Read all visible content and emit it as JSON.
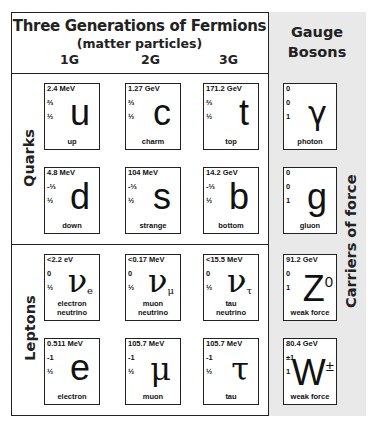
{
  "header": {
    "title": "Three Generations of Fermions",
    "subtitle": "(matter particles)",
    "generations": [
      "1G",
      "2G",
      "3G"
    ],
    "gauge_title_line1": "Gauge",
    "gauge_title_line2": "Bosons"
  },
  "row_labels": {
    "quarks": "Quarks",
    "leptons": "Leptons",
    "carriers": "Carriers of force"
  },
  "quarks": [
    {
      "mass": "2.4 MeV",
      "charge": "⅔",
      "spin": "½",
      "symbol": "u",
      "sub": "",
      "name": "up"
    },
    {
      "mass": "1.27 GeV",
      "charge": "⅔",
      "spin": "½",
      "symbol": "c",
      "sub": "",
      "name": "charm"
    },
    {
      "mass": "171.2 GeV",
      "charge": "⅔",
      "spin": "½",
      "symbol": "t",
      "sub": "",
      "name": "top"
    },
    {
      "mass": "4.8 MeV",
      "charge": "-⅓",
      "spin": "½",
      "symbol": "d",
      "sub": "",
      "name": "down"
    },
    {
      "mass": "104 MeV",
      "charge": "-⅓",
      "spin": "½",
      "symbol": "s",
      "sub": "",
      "name": "strange"
    },
    {
      "mass": "14.2 GeV",
      "charge": "-⅓",
      "spin": "½",
      "symbol": "b",
      "sub": "",
      "name": "bottom"
    }
  ],
  "leptons": [
    {
      "mass": "<2.2 eV",
      "charge": "0",
      "spin": "½",
      "symbol": "ν",
      "sub": "e",
      "name1": "electron",
      "name2": "neutrino"
    },
    {
      "mass": "<0.17 MeV",
      "charge": "0",
      "spin": "½",
      "symbol": "ν",
      "sub": "μ",
      "name1": "muon",
      "name2": "neutrino"
    },
    {
      "mass": "<15.5 MeV",
      "charge": "0",
      "spin": "½",
      "symbol": "ν",
      "sub": "τ",
      "name1": "tau",
      "name2": "neutrino"
    },
    {
      "mass": "0.511 MeV",
      "charge": "-1",
      "spin": "½",
      "symbol": "e",
      "sub": "",
      "name1": "electron",
      "name2": ""
    },
    {
      "mass": "105.7 MeV",
      "charge": "-1",
      "spin": "½",
      "symbol": "μ",
      "sub": "",
      "name1": "muon",
      "name2": ""
    },
    {
      "mass": "105.7 MeV",
      "charge": "-1",
      "spin": "½",
      "symbol": "τ",
      "sub": "",
      "name1": "tau",
      "name2": ""
    }
  ],
  "bosons": [
    {
      "mass": "0",
      "charge": "0",
      "spin": "1",
      "symbol": "γ",
      "sup": "",
      "name": "photon"
    },
    {
      "mass": "0",
      "charge": "0",
      "spin": "1",
      "symbol": "g",
      "sup": "",
      "name": "gluon"
    },
    {
      "mass": "91.2 GeV",
      "charge": "0",
      "spin": "1",
      "symbol": "Z",
      "sup": "0",
      "name": "weak force"
    },
    {
      "mass": "80.4 GeV",
      "charge": "±1",
      "spin": "1",
      "symbol": "W",
      "sup": "±",
      "name": "weak force"
    }
  ]
}
